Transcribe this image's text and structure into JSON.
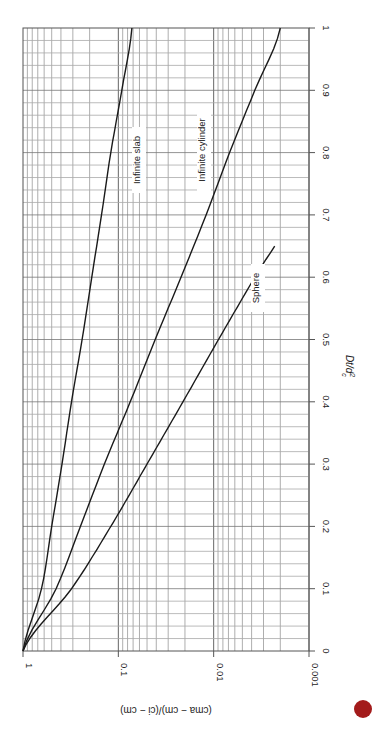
{
  "chart_data": {
    "type": "line",
    "orientation": "rotated-90-clockwise",
    "title": "",
    "xlabel": "Dt/d_c^2",
    "ylabel": "(c_ma − c_m)/(c_i − c_m)",
    "xscale": "linear",
    "yscale": "log",
    "xlim": [
      0,
      1
    ],
    "ylim": [
      0.001,
      1
    ],
    "x_ticks": [
      "0",
      "0.1",
      "0.2",
      "0.3",
      "0.4",
      "0.5",
      "0.6",
      "0.7",
      "0.8",
      "0.9",
      "1"
    ],
    "y_ticks": [
      "1",
      "0.1",
      "0.01",
      "0.001"
    ],
    "grid": true,
    "x": [
      0,
      0.1,
      0.2,
      0.3,
      0.4,
      0.5,
      0.6,
      0.7,
      0.8,
      0.9,
      1.0
    ],
    "series": [
      {
        "name": "Infinite slab",
        "values": [
          1.0,
          0.64,
          0.5,
          0.39,
          0.31,
          0.24,
          0.19,
          0.15,
          0.12,
          0.092,
          0.072
        ]
      },
      {
        "name": "Infinite cylinder",
        "values": [
          1.0,
          0.45,
          0.25,
          0.14,
          0.075,
          0.041,
          0.022,
          0.012,
          0.0068,
          0.0037,
          0.002
        ]
      },
      {
        "name": "Sphere",
        "values": [
          1.0,
          0.31,
          0.12,
          0.05,
          0.021,
          0.0089,
          0.0037,
          0.0015,
          null,
          null,
          null
        ]
      }
    ],
    "annotations": [
      "Infinite slab",
      "Infinite cylinder",
      "Sphere"
    ]
  },
  "labels": {
    "xlabel_main": "Dt/d",
    "xlabel_sup": "2",
    "xlabel_sub": "c",
    "ylabel": "(c_ma − c_m)/(c_i − c_m)"
  },
  "marker": {
    "color": "#a31b1b"
  }
}
